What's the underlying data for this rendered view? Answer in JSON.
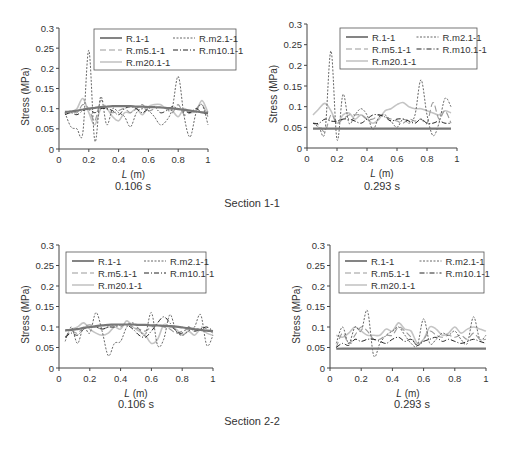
{
  "figure": {
    "section_labels": [
      "Section 1-1",
      "Section 2-2"
    ],
    "series_styles": [
      {
        "name": "R.1-1",
        "color": "#777777",
        "width": 2.2,
        "dash": ""
      },
      {
        "name": "R.m2.1-1",
        "color": "#555555",
        "width": 0.9,
        "dash": "2,1.5"
      },
      {
        "name": "R.m5.1-1",
        "color": "#9a9a9a",
        "width": 1.1,
        "dash": "6,3"
      },
      {
        "name": "R.m10.1-1",
        "color": "#222222",
        "width": 1.0,
        "dash": "5,2,1,2"
      },
      {
        "name": "R.m20.1-1",
        "color": "#c4c4c4",
        "width": 1.6,
        "dash": ""
      }
    ]
  },
  "chart_data": [
    {
      "type": "line",
      "section": "Section 1-1",
      "title": "0.106 s",
      "xlabel": "L (m)",
      "ylabel": "Stress (MPa)",
      "xlim": [
        0,
        1
      ],
      "ylim": [
        0,
        0.3
      ],
      "xticks": [
        "0",
        "0.2",
        "0.4",
        "0.6",
        "0.8",
        "1"
      ],
      "yticks": [
        "0",
        "0.05",
        "0.1",
        "0.15",
        "0.2",
        "0.25",
        "0.3"
      ],
      "legend": [
        "R.1-1",
        "R.m2.1-1",
        "R.m5.1-1",
        "R.m10.1-1",
        "R.m20.1-1"
      ],
      "legend_position": "upper right",
      "grid": false,
      "x": [
        0.04,
        0.08,
        0.12,
        0.16,
        0.2,
        0.24,
        0.28,
        0.32,
        0.36,
        0.4,
        0.44,
        0.48,
        0.52,
        0.56,
        0.6,
        0.64,
        0.68,
        0.72,
        0.76,
        0.8,
        0.84,
        0.88,
        0.92,
        0.96,
        1.0
      ],
      "series": [
        {
          "name": "R.1-1",
          "values": [
            0.092,
            0.093,
            0.095,
            0.098,
            0.1,
            0.102,
            0.104,
            0.105,
            0.106,
            0.106,
            0.106,
            0.106,
            0.105,
            0.105,
            0.104,
            0.104,
            0.103,
            0.102,
            0.101,
            0.099,
            0.097,
            0.095,
            0.093,
            0.091,
            0.09
          ]
        },
        {
          "name": "R.m2.1-1",
          "values": [
            0.09,
            0.055,
            0.05,
            0.04,
            0.245,
            0.02,
            0.13,
            0.06,
            0.1,
            0.09,
            0.08,
            0.055,
            0.09,
            0.1,
            0.095,
            0.08,
            0.06,
            0.07,
            0.1,
            0.18,
            0.08,
            0.03,
            0.09,
            0.11,
            0.06
          ]
        },
        {
          "name": "R.m5.1-1",
          "values": [
            0.09,
            0.095,
            0.09,
            0.11,
            0.1,
            0.07,
            0.12,
            0.1,
            0.09,
            0.095,
            0.1,
            0.09,
            0.1,
            0.11,
            0.095,
            0.1,
            0.105,
            0.1,
            0.09,
            0.11,
            0.085,
            0.09,
            0.1,
            0.11,
            0.08
          ]
        },
        {
          "name": "R.m10.1-1",
          "values": [
            0.085,
            0.09,
            0.085,
            0.095,
            0.1,
            0.09,
            0.1,
            0.1,
            0.095,
            0.085,
            0.1,
            0.105,
            0.1,
            0.09,
            0.1,
            0.105,
            0.09,
            0.095,
            0.105,
            0.1,
            0.095,
            0.09,
            0.1,
            0.09,
            0.088
          ]
        },
        {
          "name": "R.m20.1-1",
          "values": [
            0.09,
            0.09,
            0.1,
            0.125,
            0.09,
            0.06,
            0.1,
            0.1,
            0.08,
            0.07,
            0.09,
            0.09,
            0.1,
            0.085,
            0.105,
            0.11,
            0.11,
            0.1,
            0.095,
            0.08,
            0.1,
            0.09,
            0.095,
            0.12,
            0.09
          ]
        }
      ]
    },
    {
      "type": "line",
      "section": "Section 1-1",
      "title": "0.293 s",
      "xlabel": "L (m)",
      "ylabel": "Stress (MPa)",
      "xlim": [
        0,
        1
      ],
      "ylim": [
        0,
        0.3
      ],
      "xticks": [
        "0",
        "0.2",
        "0.4",
        "0.6",
        "0.8",
        "1"
      ],
      "yticks": [
        "0",
        "0.05",
        "0.1",
        "0.15",
        "0.2",
        "0.25",
        "0.3"
      ],
      "legend": [
        "R.1-1",
        "R.m2.1-1",
        "R.m5.1-1",
        "R.m10.1-1",
        "R.m20.1-1"
      ],
      "legend_position": "upper right",
      "grid": false,
      "x": [
        0.04,
        0.08,
        0.12,
        0.16,
        0.2,
        0.24,
        0.28,
        0.32,
        0.36,
        0.4,
        0.44,
        0.48,
        0.52,
        0.56,
        0.6,
        0.64,
        0.68,
        0.72,
        0.76,
        0.8,
        0.84,
        0.88,
        0.92,
        0.96
      ],
      "series": [
        {
          "name": "R.1-1",
          "values": [
            0.047,
            0.047,
            0.047,
            0.047,
            0.047,
            0.047,
            0.047,
            0.047,
            0.047,
            0.047,
            0.047,
            0.047,
            0.047,
            0.047,
            0.047,
            0.047,
            0.047,
            0.047,
            0.047,
            0.047,
            0.047,
            0.047,
            0.047,
            0.047
          ]
        },
        {
          "name": "R.m2.1-1",
          "values": [
            0.06,
            0.05,
            0.04,
            0.235,
            0.02,
            0.13,
            0.06,
            0.08,
            0.095,
            0.08,
            0.045,
            0.075,
            0.08,
            0.065,
            0.05,
            0.07,
            0.06,
            0.08,
            0.165,
            0.08,
            0.03,
            0.06,
            0.12,
            0.1
          ]
        },
        {
          "name": "R.m5.1-1",
          "values": [
            0.06,
            0.055,
            0.04,
            0.08,
            0.06,
            0.07,
            0.08,
            0.08,
            0.08,
            0.07,
            0.07,
            0.08,
            0.075,
            0.07,
            0.065,
            0.06,
            0.07,
            0.065,
            0.07,
            0.06,
            0.11,
            0.07,
            0.09,
            0.06
          ]
        },
        {
          "name": "R.m10.1-1",
          "values": [
            0.06,
            0.06,
            0.07,
            0.065,
            0.065,
            0.07,
            0.07,
            0.065,
            0.06,
            0.07,
            0.08,
            0.08,
            0.075,
            0.065,
            0.07,
            0.07,
            0.065,
            0.06,
            0.07,
            0.06,
            0.06,
            0.065,
            0.06,
            0.06
          ]
        },
        {
          "name": "R.m20.1-1",
          "values": [
            0.08,
            0.095,
            0.108,
            0.09,
            0.06,
            0.08,
            0.085,
            0.07,
            0.08,
            0.07,
            0.06,
            0.07,
            0.09,
            0.095,
            0.105,
            0.11,
            0.1,
            0.095,
            0.095,
            0.09,
            0.085,
            0.08,
            0.09,
            0.085
          ]
        }
      ]
    },
    {
      "type": "line",
      "section": "Section 2-2",
      "title": "0.106 s",
      "xlabel": "L (m)",
      "ylabel": "Stress (MPa)",
      "xlim": [
        0,
        1
      ],
      "ylim": [
        0,
        0.3
      ],
      "xticks": [
        "0",
        "0.2",
        "0.4",
        "0.6",
        "0.8",
        "1"
      ],
      "yticks": [
        "0",
        "0.05",
        "0.1",
        "0.15",
        "0.2",
        "0.25",
        "0.3"
      ],
      "legend": [
        "R.1-1",
        "R.m2.1-1",
        "R.m5.1-1",
        "R.m10.1-1",
        "R.m20.1-1"
      ],
      "legend_position": "upper right",
      "grid": false,
      "x": [
        0.04,
        0.08,
        0.12,
        0.16,
        0.2,
        0.24,
        0.28,
        0.32,
        0.36,
        0.4,
        0.44,
        0.48,
        0.52,
        0.56,
        0.6,
        0.64,
        0.68,
        0.72,
        0.76,
        0.8,
        0.84,
        0.88,
        0.92,
        0.96,
        1.0
      ],
      "series": [
        {
          "name": "R.1-1",
          "values": [
            0.092,
            0.093,
            0.095,
            0.098,
            0.1,
            0.102,
            0.104,
            0.105,
            0.106,
            0.106,
            0.106,
            0.106,
            0.105,
            0.105,
            0.104,
            0.104,
            0.103,
            0.102,
            0.101,
            0.099,
            0.097,
            0.095,
            0.093,
            0.091,
            0.09
          ]
        },
        {
          "name": "R.m2.1-1",
          "values": [
            0.065,
            0.1,
            0.06,
            0.1,
            0.085,
            0.135,
            0.09,
            0.03,
            0.06,
            0.065,
            0.1,
            0.11,
            0.095,
            0.08,
            0.135,
            0.055,
            0.07,
            0.13,
            0.09,
            0.08,
            0.09,
            0.1,
            0.13,
            0.055,
            0.08
          ]
        },
        {
          "name": "R.m5.1-1",
          "values": [
            0.075,
            0.09,
            0.085,
            0.1,
            0.105,
            0.1,
            0.095,
            0.1,
            0.105,
            0.1,
            0.11,
            0.1,
            0.095,
            0.09,
            0.1,
            0.105,
            0.1,
            0.095,
            0.085,
            0.09,
            0.095,
            0.09,
            0.1,
            0.095,
            0.085
          ]
        },
        {
          "name": "R.m10.1-1",
          "values": [
            0.075,
            0.085,
            0.08,
            0.095,
            0.1,
            0.1,
            0.095,
            0.1,
            0.1,
            0.105,
            0.105,
            0.095,
            0.08,
            0.075,
            0.09,
            0.11,
            0.125,
            0.11,
            0.09,
            0.085,
            0.1,
            0.09,
            0.095,
            0.1,
            0.09
          ]
        },
        {
          "name": "R.m20.1-1",
          "values": [
            0.09,
            0.095,
            0.1,
            0.11,
            0.095,
            0.085,
            0.08,
            0.085,
            0.1,
            0.095,
            0.115,
            0.1,
            0.09,
            0.08,
            0.06,
            0.07,
            0.105,
            0.1,
            0.095,
            0.08,
            0.09,
            0.08,
            0.095,
            0.085,
            0.08
          ]
        }
      ]
    },
    {
      "type": "line",
      "section": "Section 2-2",
      "title": "0.293 s",
      "xlabel": "L (m)",
      "ylabel": "Stress (MPa)",
      "xlim": [
        0,
        1
      ],
      "ylim": [
        0,
        0.3
      ],
      "xticks": [
        "0",
        "0.2",
        "0.4",
        "0.6",
        "0.8",
        "1"
      ],
      "yticks": [
        "0",
        "0.05",
        "0.1",
        "0.15",
        "0.2",
        "0.25",
        "0.3"
      ],
      "legend": [
        "R.1-1",
        "R.m2.1-1",
        "R.m5.1-1",
        "R.m10.1-1",
        "R.m20.1-1"
      ],
      "legend_position": "upper right",
      "grid": false,
      "x": [
        0.04,
        0.08,
        0.12,
        0.16,
        0.2,
        0.24,
        0.28,
        0.32,
        0.36,
        0.4,
        0.44,
        0.48,
        0.52,
        0.56,
        0.6,
        0.64,
        0.68,
        0.72,
        0.76,
        0.8,
        0.84,
        0.88,
        0.92,
        0.96,
        1.0
      ],
      "series": [
        {
          "name": "R.1-1",
          "values": [
            0.047,
            0.047,
            0.047,
            0.047,
            0.047,
            0.047,
            0.047,
            0.047,
            0.047,
            0.047,
            0.047,
            0.047,
            0.047,
            0.047,
            0.047,
            0.047,
            0.047,
            0.047,
            0.047,
            0.047,
            0.047,
            0.047,
            0.047,
            0.047,
            0.047
          ]
        },
        {
          "name": "R.m2.1-1",
          "values": [
            0.06,
            0.1,
            0.06,
            0.1,
            0.09,
            0.14,
            0.03,
            0.06,
            0.08,
            0.09,
            0.1,
            0.08,
            0.06,
            0.055,
            0.12,
            0.06,
            0.07,
            0.085,
            0.08,
            0.09,
            0.07,
            0.06,
            0.125,
            0.07,
            0.08
          ]
        },
        {
          "name": "R.m5.1-1",
          "values": [
            0.05,
            0.085,
            0.06,
            0.08,
            0.1,
            0.09,
            0.07,
            0.07,
            0.08,
            0.08,
            0.1,
            0.09,
            0.075,
            0.055,
            0.07,
            0.09,
            0.08,
            0.075,
            0.08,
            0.075,
            0.08,
            0.07,
            0.085,
            0.07,
            0.07
          ]
        },
        {
          "name": "R.m10.1-1",
          "values": [
            0.05,
            0.06,
            0.055,
            0.07,
            0.065,
            0.07,
            0.07,
            0.065,
            0.06,
            0.07,
            0.075,
            0.065,
            0.07,
            0.055,
            0.065,
            0.07,
            0.075,
            0.065,
            0.07,
            0.065,
            0.06,
            0.065,
            0.07,
            0.065,
            0.06
          ]
        },
        {
          "name": "R.m20.1-1",
          "values": [
            0.08,
            0.075,
            0.085,
            0.1,
            0.09,
            0.08,
            0.08,
            0.08,
            0.095,
            0.09,
            0.11,
            0.095,
            0.09,
            0.06,
            0.07,
            0.1,
            0.095,
            0.08,
            0.085,
            0.1,
            0.085,
            0.095,
            0.1,
            0.095,
            0.09
          ]
        }
      ]
    }
  ],
  "layout": [
    {
      "ax_left": 59,
      "ax_top": 28,
      "ax_w": 149,
      "ax_h": 121,
      "legend_x": 94,
      "legend_y": 29,
      "caption_x": 133,
      "caption_y": 186
    },
    {
      "ax_left": 307,
      "ax_top": 24,
      "ax_w": 150,
      "ax_h": 124,
      "legend_x": 340,
      "legend_y": 28,
      "caption_x": 382,
      "caption_y": 186
    },
    {
      "ax_left": 59,
      "ax_top": 245,
      "ax_w": 154,
      "ax_h": 123,
      "legend_x": 66,
      "legend_y": 252,
      "caption_x": 136,
      "caption_y": 404
    },
    {
      "ax_left": 330,
      "ax_top": 245,
      "ax_w": 156,
      "ax_h": 123,
      "legend_x": 339,
      "legend_y": 252,
      "caption_x": 412,
      "caption_y": 404
    }
  ],
  "section_positions": [
    {
      "x": 252,
      "y": 203
    },
    {
      "x": 252,
      "y": 421
    }
  ]
}
